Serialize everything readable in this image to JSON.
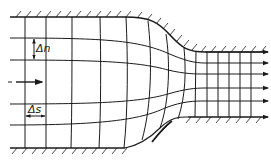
{
  "diagram": {
    "type": "flow-net",
    "labels": {
      "delta_n": "Δn",
      "delta_s": "Δs"
    },
    "colors": {
      "line": "#1a1a1a",
      "background": "#ffffff"
    },
    "walls": [
      "top-wall",
      "bottom-wall"
    ],
    "streamline_count": 6,
    "flow_direction": "left-to-right"
  }
}
